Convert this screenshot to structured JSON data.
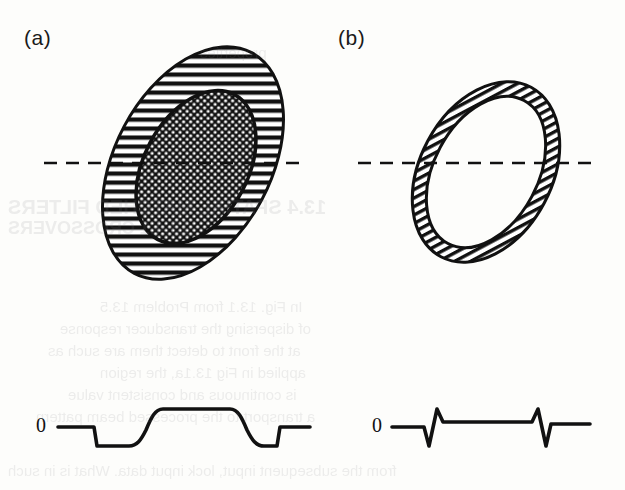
{
  "figure": {
    "type": "scientific-diagram",
    "background_color": "#fdfdfb",
    "ink_color": "#111111",
    "panels": [
      {
        "id": "a",
        "label": "(a)",
        "shape": {
          "name": "hatched-ellipse-with-stippled-core",
          "outer": {
            "fill_pattern": "diagonal-hatch",
            "center_x": 193,
            "center_y": 163,
            "rx": 78,
            "ry": 125,
            "rotation_deg": 28
          },
          "inner": {
            "fill_pattern": "stipple-dots",
            "center_x": 196,
            "center_y": 167,
            "rx": 52,
            "ry": 82,
            "rotation_deg": 28
          }
        },
        "axis_line": {
          "name": "dashed-scan-line",
          "style": "dashed",
          "y": 163,
          "x_start": 44,
          "x_end": 300
        },
        "waveform": {
          "name": "flat-top-pulse-profile",
          "baseline_label": "0",
          "baseline_y": 427,
          "plateau_y": 409,
          "dip_y": 446,
          "description": "flat baseline, negative step, rounded rise to flat positive plateau, rounded fall to negative step, return to baseline"
        }
      },
      {
        "id": "b",
        "label": "(b)",
        "shape": {
          "name": "hatched-annulus-ring",
          "outer": {
            "fill_pattern": "diagonal-hatch",
            "center_x": 486,
            "center_y": 172,
            "rx": 66,
            "ry": 96,
            "rotation_deg": 28
          },
          "inner": {
            "fill_pattern": "none",
            "center_x": 486,
            "center_y": 172,
            "rx": 52,
            "ry": 81,
            "rotation_deg": 28
          }
        },
        "axis_line": {
          "name": "dashed-scan-line",
          "style": "dashed",
          "y": 163,
          "x_start": 358,
          "x_end": 600
        },
        "waveform": {
          "name": "bipolar-spike-profile",
          "baseline_label": "0",
          "baseline_y": 427,
          "peak_y": 409,
          "trough_y": 446,
          "description": "flat baseline with two narrow bipolar spikes, first down-then-up, second up-then-down"
        }
      }
    ]
  },
  "background_bleed_text": [
    {
      "text": "properties",
      "x": 200,
      "y": 44,
      "size": 15
    },
    {
      "text": "13.4  SPATIAL MATCHED  FILTERS",
      "x": 8,
      "y": 196,
      "size": 20,
      "weight": "bold"
    },
    {
      "text": "13.4.1  CROSSOVERS",
      "x": 8,
      "y": 218,
      "size": 18,
      "weight": "bold"
    },
    {
      "text": "In Fig. 13.1  from Problem 13.5",
      "x": 100,
      "y": 298,
      "size": 15
    },
    {
      "text": "of dispersing the transducer response",
      "x": 60,
      "y": 320,
      "size": 15
    },
    {
      "text": "at the front to detect them are such as",
      "x": 48,
      "y": 342,
      "size": 15
    },
    {
      "text": "applied in Fig 13.1a, the region",
      "x": 100,
      "y": 364,
      "size": 15
    },
    {
      "text": "is continuous and consistent value",
      "x": 68,
      "y": 386,
      "size": 15
    },
    {
      "text": "a  transport to the processed beam pattern",
      "x": 36,
      "y": 408,
      "size": 15
    },
    {
      "text": "from the subsequent input, lock input data. What is in such",
      "x": 8,
      "y": 462,
      "size": 15
    }
  ]
}
